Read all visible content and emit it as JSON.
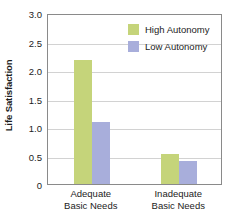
{
  "chart_data": {
    "type": "bar",
    "title": "",
    "subtitle": "",
    "xlabel": "",
    "ylabel": "Life Satisfaction",
    "categories": [
      "Adequate Basic Needs",
      "Inadequate Basic Needs"
    ],
    "category_lines": [
      [
        "Adequate",
        "Basic Needs"
      ],
      [
        "Inadequate",
        "Basic Needs"
      ]
    ],
    "series": [
      {
        "name": "High Autonomy",
        "values": [
          2.2,
          0.53
        ],
        "color": "#c5d47a"
      },
      {
        "name": "Low Autonomy",
        "values": [
          1.1,
          0.4
        ],
        "color": "#a8aedb"
      }
    ],
    "ylim": [
      0,
      3.0
    ],
    "yticks": [
      0,
      0.5,
      1.0,
      1.5,
      2.0,
      2.5,
      3.0
    ],
    "ytick_labels": [
      "0",
      "0.5",
      "1.0",
      "1.5",
      "2.0",
      "2.5",
      "3.0"
    ],
    "grid": "horizontal",
    "legend_position": "top-right-inside",
    "plot_border_color": "#8a8a8a",
    "gridline_color": "#d2d2d2",
    "background_color": "#ffffff",
    "text_color": "#1c1c1c"
  }
}
